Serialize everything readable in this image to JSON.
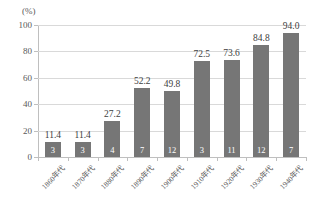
{
  "chart_data": {
    "type": "bar",
    "title": "",
    "subtitle": "",
    "xlabel": "",
    "ylabel": "",
    "unit_label": "(%)",
    "categories": [
      "1860年代",
      "1870年代",
      "1880年代",
      "1890年代",
      "1900年代",
      "1910年代",
      "1920年代",
      "1930年代",
      "1940年代"
    ],
    "values": [
      11.4,
      11.4,
      27.2,
      52.2,
      49.8,
      72.5,
      73.6,
      84.8,
      94.0
    ],
    "value_labels": [
      "11.4",
      "11.4",
      "27.2",
      "52.2",
      "49.8",
      "72.5",
      "73.6",
      "84.8",
      "94.0"
    ],
    "in_bar_counts": [
      3,
      3,
      4,
      7,
      12,
      3,
      11,
      12,
      7
    ],
    "in_bar_labels": [
      "3",
      "3",
      "4",
      "7",
      "12",
      "3",
      "11",
      "12",
      "7"
    ],
    "ylim": [
      0,
      100
    ],
    "yticks": [
      0,
      20,
      40,
      60,
      80,
      100
    ],
    "ytick_labels": [
      "0",
      "20",
      "40",
      "60",
      "80",
      "100"
    ],
    "grid": true,
    "grid_axis": "y",
    "legend": false,
    "legend_position": "none",
    "bar_color": "#767676",
    "grid_color": "#d9d9d9",
    "axis_color": "#bfbfbf",
    "label_color": "#595959",
    "value_label_color": "#404040",
    "in_bar_label_color": "#ffffff",
    "background_color": "#ffffff"
  }
}
